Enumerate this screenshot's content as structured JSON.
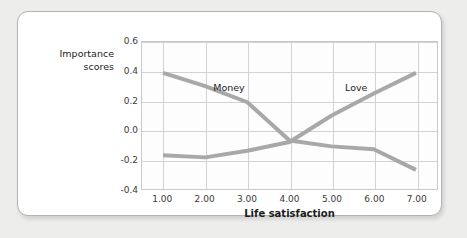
{
  "figure": {
    "background_color": "#ededeb",
    "card_background_color": "#ffffff",
    "card_border_color": "#b3b3b3"
  },
  "chart_data": {
    "type": "line",
    "title": "",
    "subtitle": "",
    "xlabel": "Life satisfaction",
    "ylabel": "Importance\nscores",
    "x": [
      1,
      2,
      3,
      4,
      5,
      6,
      7
    ],
    "xticklabels": [
      "1.00",
      "2.00",
      "3.00",
      "4.00",
      "5.00",
      "6.00",
      "7.00"
    ],
    "yticklabels": [
      "0.6",
      "0.4",
      "0.2",
      "0.0",
      "-0.2",
      "-0.4"
    ],
    "ytickvalues": [
      0.6,
      0.4,
      0.2,
      0.0,
      -0.2,
      -0.4
    ],
    "xlim": [
      0.5,
      7.5
    ],
    "ylim": [
      -0.4,
      0.6
    ],
    "grid": true,
    "legend_position": "inline-annotations",
    "series": [
      {
        "name": "Money",
        "color": "#a8a8a8",
        "values": [
          0.39,
          0.3,
          0.19,
          -0.07,
          -0.11,
          -0.13,
          -0.27
        ],
        "label_x": 2.55,
        "label_y": 0.3
      },
      {
        "name": "Love",
        "color": "#a8a8a8",
        "values": [
          -0.17,
          -0.185,
          -0.14,
          -0.08,
          0.1,
          0.25,
          0.39
        ],
        "label_x": 5.55,
        "label_y": 0.3
      }
    ],
    "annotations": [
      {
        "text": "Money",
        "x": 2.55,
        "y": 0.3
      },
      {
        "text": "Love",
        "x": 5.55,
        "y": 0.3
      }
    ],
    "line_color": "#a8a8a8",
    "grid_color": "#d2d2d2",
    "axis_color": "#c9c9c9"
  }
}
